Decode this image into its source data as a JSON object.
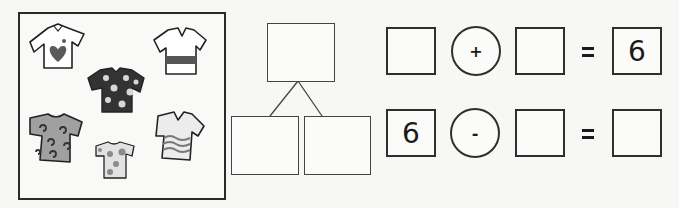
{
  "picture": {
    "description": "Six shirts",
    "shirts": [
      {
        "pattern": "heart",
        "label": "shirt-heart"
      },
      {
        "pattern": "stripe",
        "label": "shirt-stripe"
      },
      {
        "pattern": "flowers",
        "label": "shirt-flowers"
      },
      {
        "pattern": "swirls",
        "label": "shirt-swirls"
      },
      {
        "pattern": "dots",
        "label": "shirt-dots"
      },
      {
        "pattern": "waves",
        "label": "shirt-waves"
      }
    ]
  },
  "number_bond": {
    "whole": "",
    "part_left": "",
    "part_right": ""
  },
  "equations": [
    {
      "a": "",
      "operator": "+",
      "b": "",
      "equals": "=",
      "result": "6"
    },
    {
      "a": "6",
      "operator": "-",
      "b": "",
      "equals": "=",
      "result": ""
    }
  ],
  "colors": {
    "line": "#2f2f2f",
    "shirt_fill_dark": "#3a3a3a",
    "shirt_fill_mid": "#8a8a8a",
    "shirt_fill_light": "#c8c8c8"
  }
}
